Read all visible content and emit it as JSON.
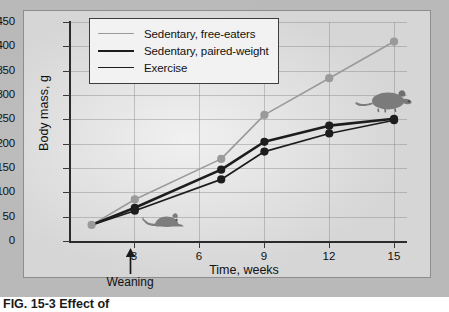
{
  "figure": {
    "caption": "FIG. 15-3  Effect of"
  },
  "chart_data": {
    "type": "line",
    "title": "",
    "xlabel": "Time, weeks",
    "ylabel": "Body mass, g",
    "xlim": [
      0,
      15.6
    ],
    "ylim": [
      0,
      450
    ],
    "xticks": [
      3,
      6,
      9,
      12,
      15
    ],
    "xtick_labels": [
      "3",
      "6",
      "9",
      "12",
      "15"
    ],
    "yticks": [
      0,
      50,
      100,
      150,
      200,
      250,
      300,
      350,
      400,
      450
    ],
    "ytick_labels": [
      "0",
      "50",
      "100",
      "150",
      "200",
      "250",
      "300",
      "350",
      "400",
      "450"
    ],
    "grid": true,
    "legend_position": "top-left",
    "series": [
      {
        "name": "Sedentary, free-eaters",
        "color": "#9a9a9a",
        "line_width": 1.6,
        "marker": "circle",
        "x": [
          1,
          3,
          7,
          9,
          12,
          15
        ],
        "values": [
          35,
          87,
          170,
          260,
          335,
          410
        ]
      },
      {
        "name": "Sedentary, paired-weight",
        "color": "#1d1d1d",
        "line_width": 2.6,
        "marker": "circle",
        "x": [
          1,
          3,
          7,
          9,
          12,
          15
        ],
        "values": [
          35,
          70,
          148,
          205,
          238,
          252
        ]
      },
      {
        "name": "Exercise",
        "color": "#1d1d1d",
        "line_width": 1.7,
        "marker": "circle",
        "x": [
          1,
          3,
          7,
          9,
          12,
          15
        ],
        "values": [
          35,
          64,
          128,
          185,
          222,
          249
        ]
      }
    ],
    "annotations": [
      {
        "name": "weaning",
        "label": "Weaning",
        "x": 3,
        "type": "arrow-up"
      },
      {
        "name": "rat-pup-icon",
        "label": "young rat",
        "x": 4,
        "y": 25
      },
      {
        "name": "rat-adult-icon",
        "label": "adult rat",
        "x": 13,
        "y": 300
      }
    ]
  },
  "legend": {
    "entries": [
      {
        "label": "Sedentary, free-eaters",
        "color": "#9a9a9a",
        "width": "1.6px"
      },
      {
        "label": "Sedentary, paired-weight",
        "color": "#1d1d1d",
        "width": "2.8px"
      },
      {
        "label": "Exercise",
        "color": "#1d1d1d",
        "width": "1.7px"
      }
    ]
  },
  "annotations": {
    "weaning_label": "Weaning"
  }
}
